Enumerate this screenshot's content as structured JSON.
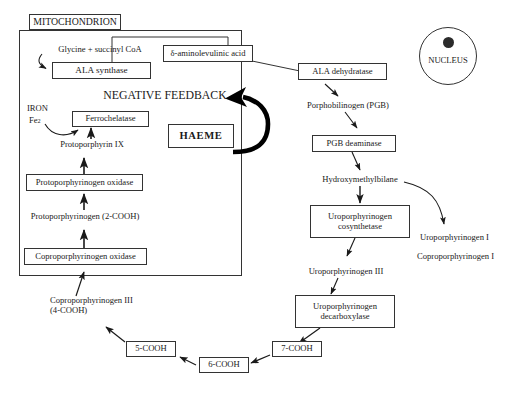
{
  "diagram": {
    "compartments": {
      "mitochondrion_label": "MITOCHONDRION",
      "nucleus_label": "NUCLEUS"
    },
    "colors": {
      "stroke": "#333333",
      "text": "#1a1a1a",
      "background": "#ffffff",
      "feedback_arrow": "#000000"
    },
    "nodes": {
      "mitochondrion_tag": "MITOCHONDRION",
      "glycine_succinyl": "Glycine + succinyl CoA",
      "ala_synthase": "ALA synthase",
      "ala_acid": "δ-aminolevulinic acid",
      "negative_feedback": "NEGATIVE FEEDBACK",
      "iron": "IRON",
      "iron_ion_main": "Fe",
      "iron_ion_sup": "2",
      "ferrochelatase": "Ferrochelatase",
      "haeme": "HAEME",
      "protoporphyrin_ix": "Protoporphyrin IX",
      "protoporphyrinogen_oxidase": "Protoporphyrinogen oxidase",
      "protoporphyrinogen_2cooh": "Protoporphyrinogen (2-COOH)",
      "coproporphyrinogen_oxidase": "Coproporphyrinogen oxidase",
      "coproporphyrinogen_iii_line1": "Coproporphyrinogen III",
      "coproporphyrinogen_iii_line2": "(4-COOH)",
      "ala_dehydratase": "ALA dehydratase",
      "porphobilinogen": "Porphobilinogen (PGB)",
      "pgb_deaminase": "PGB deaminase",
      "hydroxymethylbilane": "Hydroxymethylbilane",
      "uroporphyrinogen_cosynthetase_line1": "Uroporphyrinogen",
      "uroporphyrinogen_cosynthetase_line2": "cosynthetase",
      "uroporphyrinogen_i": "Uroporphyrinogen I",
      "coproporphyrinogen_i": "Coproporphyrinogen I",
      "uroporphyrinogen_iii": "Uroporphyrinogen III",
      "uroporphyrinogen_decarboxylase_line1": "Uroporphyrinogen",
      "uroporphyrinogen_decarboxylase_line2": "decarboxylase",
      "cooh7": "7-COOH",
      "cooh6": "6-COOH",
      "cooh5": "5-COOH",
      "nucleus": "NUCLEUS"
    },
    "edges": [
      {
        "from": "glycine_succinyl",
        "to": "ala_synthase",
        "style": "curved-arrow"
      },
      {
        "from": "ala_synthase",
        "to": "ala_acid",
        "style": "elbow-line"
      },
      {
        "from": "ala_acid",
        "to": "ala_dehydratase",
        "style": "diagonal-line"
      },
      {
        "from": "ala_dehydratase",
        "to": "porphobilinogen",
        "style": "arrow"
      },
      {
        "from": "porphobilinogen",
        "to": "pgb_deaminase",
        "style": "arrow"
      },
      {
        "from": "pgb_deaminase",
        "to": "hydroxymethylbilane",
        "style": "arrow"
      },
      {
        "from": "hydroxymethylbilane",
        "to": "uroporphyrinogen_cosynthetase",
        "style": "arrow"
      },
      {
        "from": "hydroxymethylbilane",
        "to": "uroporphyrinogen_i",
        "style": "curved-arrow"
      },
      {
        "from": "uroporphyrinogen_cosynthetase",
        "to": "uroporphyrinogen_iii",
        "style": "arrow"
      },
      {
        "from": "uroporphyrinogen_iii",
        "to": "uroporphyrinogen_decarboxylase",
        "style": "arrow"
      },
      {
        "from": "uroporphyrinogen_decarboxylase",
        "to": "cooh7",
        "style": "arrow"
      },
      {
        "from": "cooh7",
        "to": "cooh6",
        "style": "arrow"
      },
      {
        "from": "cooh6",
        "to": "cooh5",
        "style": "arrow"
      },
      {
        "from": "cooh5",
        "to": "coproporphyrinogen_iii",
        "style": "arrow"
      },
      {
        "from": "coproporphyrinogen_iii",
        "to": "coproporphyrinogen_oxidase",
        "style": "arrow"
      },
      {
        "from": "coproporphyrinogen_oxidase",
        "to": "protoporphyrinogen_2cooh",
        "style": "arrow"
      },
      {
        "from": "protoporphyrinogen_2cooh",
        "to": "protoporphyrinogen_oxidase",
        "style": "arrow"
      },
      {
        "from": "protoporphyrinogen_oxidase",
        "to": "protoporphyrin_ix",
        "style": "arrow"
      },
      {
        "from": "protoporphyrin_ix",
        "to": "ferrochelatase",
        "style": "arrow"
      },
      {
        "from": "iron",
        "to": "ferrochelatase",
        "style": "curved-arrow"
      },
      {
        "from": "haeme",
        "to": "negative_feedback",
        "style": "thick-curved-feedback-arrow"
      }
    ]
  }
}
